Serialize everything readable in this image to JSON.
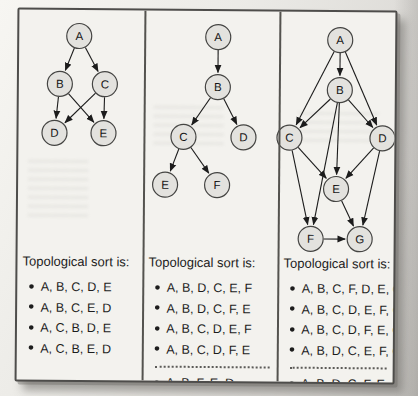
{
  "figure": {
    "colors": {
      "node_fill": "#e3e2de",
      "node_stroke": "#454543",
      "edge": "#1c1c1c",
      "box_background": "#f3f2ee",
      "box_border": "#4e4d4b",
      "page_background": "#e9e7e3",
      "text": "#1d1d1d"
    },
    "node_radius": 12.5,
    "panels": [
      {
        "title": "Topological sort is:",
        "sorts": [
          "A, B, C, D, E",
          "A, B, C, E, D",
          "A, C, B, D, E",
          "A, C, B, E, D"
        ],
        "sorts_after_separator": [],
        "graph": {
          "nodes": [
            {
              "id": "A",
              "x": 60,
              "y": 26
            },
            {
              "id": "B",
              "x": 41,
              "y": 74
            },
            {
              "id": "C",
              "x": 86,
              "y": 74
            },
            {
              "id": "D",
              "x": 36,
              "y": 123
            },
            {
              "id": "E",
              "x": 85,
              "y": 123
            }
          ],
          "edges": [
            [
              "A",
              "B"
            ],
            [
              "A",
              "C"
            ],
            [
              "B",
              "D"
            ],
            [
              "B",
              "E"
            ],
            [
              "C",
              "D"
            ],
            [
              "C",
              "E"
            ]
          ]
        }
      },
      {
        "title": "Topological sort is:",
        "sorts": [
          "A, B, D, C, E, F",
          "A, B, D, C, F, E",
          "A, B, C, D, E, F",
          "A, B, C, D, F, E"
        ],
        "sorts_after_separator": [
          "A, B, F, E, D"
        ],
        "graph": {
          "nodes": [
            {
              "id": "A",
              "x": 199,
              "y": 26
            },
            {
              "id": "B",
              "x": 199,
              "y": 76
            },
            {
              "id": "C",
              "x": 165,
              "y": 126
            },
            {
              "id": "D",
              "x": 225,
              "y": 126
            },
            {
              "id": "E",
              "x": 147,
              "y": 174
            },
            {
              "id": "F",
              "x": 199,
              "y": 174
            }
          ],
          "edges": [
            [
              "A",
              "B"
            ],
            [
              "B",
              "C"
            ],
            [
              "B",
              "D"
            ],
            [
              "C",
              "E"
            ],
            [
              "C",
              "F"
            ]
          ]
        }
      },
      {
        "title": "Topological sort is:",
        "sorts": [
          "A, B, C, F, D, E, C",
          "A, B, C, D, E, F, G",
          "A, B, C, D, F, E, G",
          "A, B, D, C, E, F, G"
        ],
        "sorts_after_separator": [
          "A, B, D, C, F, E, G"
        ],
        "graph": {
          "nodes": [
            {
              "id": "A",
              "x": 321,
              "y": 28
            },
            {
              "id": "B",
              "x": 321,
              "y": 78
            },
            {
              "id": "C",
              "x": 271,
              "y": 126
            },
            {
              "id": "D",
              "x": 364,
              "y": 126
            },
            {
              "id": "E",
              "x": 318,
              "y": 177
            },
            {
              "id": "F",
              "x": 293,
              "y": 227
            },
            {
              "id": "G",
              "x": 342,
              "y": 227
            }
          ],
          "edges": [
            [
              "A",
              "B"
            ],
            [
              "A",
              "C"
            ],
            [
              "A",
              "D"
            ],
            [
              "B",
              "C"
            ],
            [
              "B",
              "D"
            ],
            [
              "B",
              "E"
            ],
            [
              "B",
              "F"
            ],
            [
              "C",
              "E"
            ],
            [
              "C",
              "F"
            ],
            [
              "D",
              "E"
            ],
            [
              "D",
              "G"
            ],
            [
              "E",
              "G"
            ],
            [
              "F",
              "G"
            ]
          ]
        }
      }
    ]
  }
}
